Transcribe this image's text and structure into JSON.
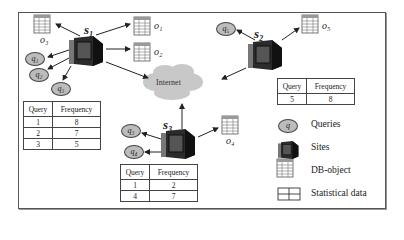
{
  "diagram": {
    "cloud_label": "Internet",
    "sites": [
      {
        "id": "s1",
        "label": "s₁"
      },
      {
        "id": "s2",
        "label": "s₂"
      },
      {
        "id": "s3",
        "label": "s₃"
      }
    ],
    "queries": [
      {
        "id": "q1",
        "label": "q₁"
      },
      {
        "id": "q2",
        "label": "q₂"
      },
      {
        "id": "q3_s1",
        "label": "q₃"
      },
      {
        "id": "q3_s3",
        "label": "q₃"
      },
      {
        "id": "q4",
        "label": "q₄"
      },
      {
        "id": "q5",
        "label": "q₅"
      }
    ],
    "objects": [
      {
        "id": "o1",
        "label": "o₁"
      },
      {
        "id": "o2",
        "label": "o₂"
      },
      {
        "id": "o3",
        "label": "o₃"
      },
      {
        "id": "o4",
        "label": "o₄"
      },
      {
        "id": "o5",
        "label": "o₅"
      }
    ],
    "tables": {
      "s1": {
        "headers": [
          "Query",
          "Frequency"
        ],
        "rows": [
          [
            "1",
            "8"
          ],
          [
            "2",
            "7"
          ],
          [
            "3",
            "5"
          ]
        ]
      },
      "s2": {
        "headers": [
          "Query",
          "Frequency"
        ],
        "rows": [
          [
            "5",
            "8"
          ]
        ]
      },
      "s3": {
        "headers": [
          "Query",
          "Frequency"
        ],
        "rows": [
          [
            "1",
            "2"
          ],
          [
            "4",
            "7"
          ]
        ]
      }
    },
    "legend": [
      {
        "icon": "query-bubble-icon",
        "symbol": "q",
        "label": "Queries"
      },
      {
        "icon": "computer-icon",
        "label": "Sites"
      },
      {
        "icon": "db-table-icon",
        "label": "DB-object"
      },
      {
        "icon": "grid-icon",
        "label": "Statistical data"
      }
    ]
  },
  "colors": {
    "cloud": "#c8c8c8",
    "bubble": "#bcbcbc",
    "frame": "#555555"
  }
}
